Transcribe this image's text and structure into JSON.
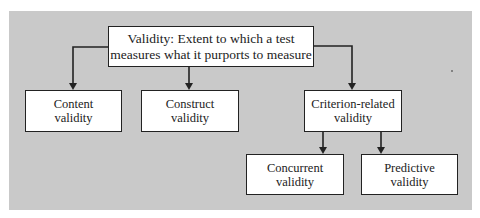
{
  "diagram": {
    "type": "hierarchy",
    "root": {
      "id": "validity",
      "lines": [
        "Validity:  Extent to which a test",
        "measures what it purports to measure"
      ]
    },
    "nodes": [
      {
        "id": "content",
        "lines": [
          "Content",
          "validity"
        ],
        "parent": "validity"
      },
      {
        "id": "construct",
        "lines": [
          "Construct",
          "validity"
        ],
        "parent": "validity"
      },
      {
        "id": "criterion",
        "lines": [
          "Criterion-related",
          "validity"
        ],
        "parent": "validity"
      },
      {
        "id": "concurrent",
        "lines": [
          "Concurrent",
          "validity"
        ],
        "parent": "criterion"
      },
      {
        "id": "predictive",
        "lines": [
          "Predictive",
          "validity"
        ],
        "parent": "criterion"
      }
    ],
    "edges": [
      {
        "from": "validity",
        "to": "content"
      },
      {
        "from": "validity",
        "to": "construct"
      },
      {
        "from": "validity",
        "to": "criterion"
      },
      {
        "from": "criterion",
        "to": "concurrent"
      },
      {
        "from": "criterion",
        "to": "predictive"
      }
    ],
    "colors": {
      "panel": "#c9c9c9",
      "box": "#ffffff",
      "line": "#222222",
      "text": "#222222"
    }
  }
}
